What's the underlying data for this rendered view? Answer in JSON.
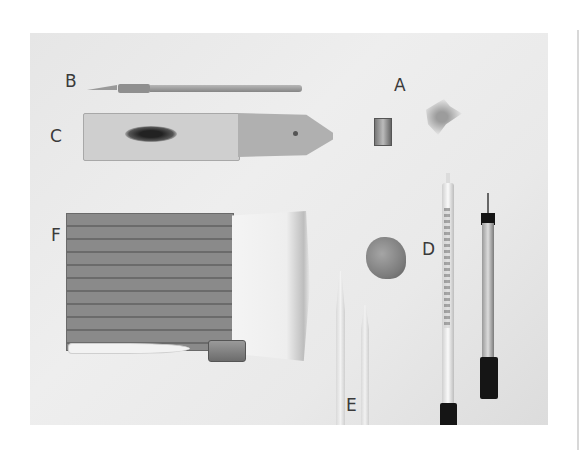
{
  "image": {
    "description": "Photograph of drawing and charcoal art tools on a light background, labeled with letters A–F",
    "background_color": "#e8e8e8",
    "page_background": "#ffffff"
  },
  "labels": {
    "A": "A",
    "B": "B",
    "C": "C",
    "D": "D",
    "E": "E",
    "F": "F"
  },
  "objects": [
    {
      "label": "A",
      "name": "pencil sharpener and shavings"
    },
    {
      "label": "B",
      "name": "craft knife"
    },
    {
      "label": "C",
      "name": "sandpaper block"
    },
    {
      "label": "D",
      "name": "kneaded eraser"
    },
    {
      "label": "E",
      "name": "blending stumps"
    },
    {
      "label": "F",
      "name": "hake brush"
    },
    {
      "label": "",
      "name": "chalk stick"
    },
    {
      "label": "",
      "name": "metal sharpener"
    },
    {
      "label": "",
      "name": "white pencil"
    },
    {
      "label": "",
      "name": "fineliner pen"
    }
  ]
}
